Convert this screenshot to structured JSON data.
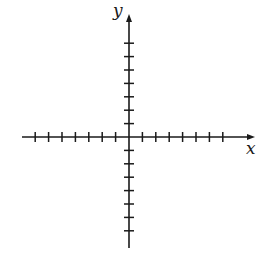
{
  "diagram": {
    "type": "coordinate-plane",
    "x_axis_label": "x",
    "y_axis_label": "y",
    "origin": [
      129,
      137
    ],
    "tick_spacing_px": 13.4,
    "x_ticks_negative": 7,
    "x_ticks_positive": 7,
    "y_ticks_positive": 7,
    "y_ticks_negative": 7,
    "x_axis_extent": [
      22,
      255
    ],
    "y_axis_extent": [
      14,
      248
    ],
    "stroke_color": "#1a1a1a",
    "tick_half_length": 5
  }
}
